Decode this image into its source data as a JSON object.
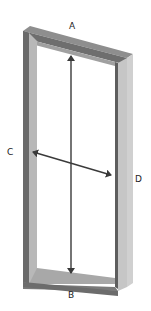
{
  "diagram": {
    "type": "frame-with-diagonals",
    "colors": {
      "background": "#ffffff",
      "frame_front": "#7a7a7a",
      "frame_top": "#8e8e8e",
      "frame_inner_side": "#b4b4b4",
      "frame_outer_side": "#c2c2c2",
      "frame_dark_edge": "#5e5e5e",
      "arrow": "#3a3a3a",
      "label": "#222222"
    },
    "labels": {
      "a": "A",
      "b": "B",
      "c": "C",
      "d": "D"
    },
    "arrows": [
      {
        "name": "A-B",
        "from": "A",
        "to": "B",
        "orientation": "vertical",
        "heads": "both"
      },
      {
        "name": "C-D",
        "from": "C",
        "to": "D",
        "orientation": "diagonal",
        "heads": "both"
      }
    ]
  }
}
